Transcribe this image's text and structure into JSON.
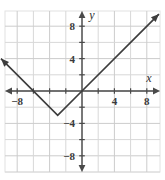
{
  "chart_data": {
    "type": "line",
    "title": "",
    "xlabel": "x",
    "ylabel": "y",
    "xlim": [
      -10,
      10
    ],
    "ylim": [
      -10,
      10
    ],
    "grid": true,
    "grid_step": 2,
    "legend": "none",
    "x_ticks": [
      -8,
      4,
      8
    ],
    "x_tick_labels": [
      "−8",
      "4",
      "8"
    ],
    "y_ticks": [
      8,
      4,
      -4,
      -8
    ],
    "y_tick_labels": [
      "8",
      "4",
      "−4",
      "−8"
    ],
    "series": [
      {
        "name": "absolute-value-graph",
        "type": "piecewise-linear",
        "arrows": "both",
        "points": [
          {
            "x": -10,
            "y": 4
          },
          {
            "x": -3,
            "y": -3
          },
          {
            "x": 0,
            "y": 0
          },
          {
            "x": 9.5,
            "y": 9.5
          }
        ],
        "vertex": {
          "x": -3,
          "y": -3
        },
        "x_intercepts": [
          -6,
          0
        ],
        "color": "#3d3d3d"
      }
    ]
  },
  "axes": {
    "x_axis_label": "x",
    "y_axis_label": "y",
    "x_arrow_left": "arrow",
    "x_arrow_right": "arrow",
    "y_arrow_top": "arrow",
    "y_arrow_bottom": "arrow"
  },
  "colors": {
    "grid": "#d8d8d8",
    "grid_major": "#cccccc",
    "axis": "#4a4a4a",
    "curve": "#3d3d3d",
    "frame": "#e2e2e2",
    "background": "#ffffff",
    "text": "#3a3a3a"
  },
  "geometry": {
    "origin_x": 82,
    "origin_y": 91,
    "unit_px": 8.1,
    "frame": {
      "left": 5,
      "top": 11,
      "right": 160,
      "bottom": 172
    }
  }
}
